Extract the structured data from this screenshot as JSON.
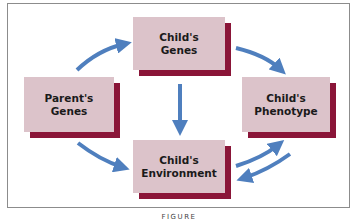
{
  "diagram": {
    "colors": {
      "box_fill": "#dcc3ca",
      "box_shadow": "#8a1538",
      "arrow": "#4f7fbe",
      "frame": "#8c8c8c"
    },
    "nodes": [
      {
        "id": "parent-genes",
        "label": "Parent's\nGenes"
      },
      {
        "id": "child-genes",
        "label": "Child's\nGenes"
      },
      {
        "id": "child-phenotype",
        "label": "Child's\nPhenotype"
      },
      {
        "id": "child-environment",
        "label": "Child's\nEnvironment"
      }
    ],
    "edges": [
      {
        "from": "parent-genes",
        "to": "child-genes"
      },
      {
        "from": "parent-genes",
        "to": "child-environment"
      },
      {
        "from": "child-genes",
        "to": "child-phenotype"
      },
      {
        "from": "child-genes",
        "to": "child-environment"
      },
      {
        "from": "child-environment",
        "to": "child-phenotype"
      },
      {
        "from": "child-phenotype",
        "to": "child-environment"
      }
    ],
    "caption": "FIGURE"
  }
}
